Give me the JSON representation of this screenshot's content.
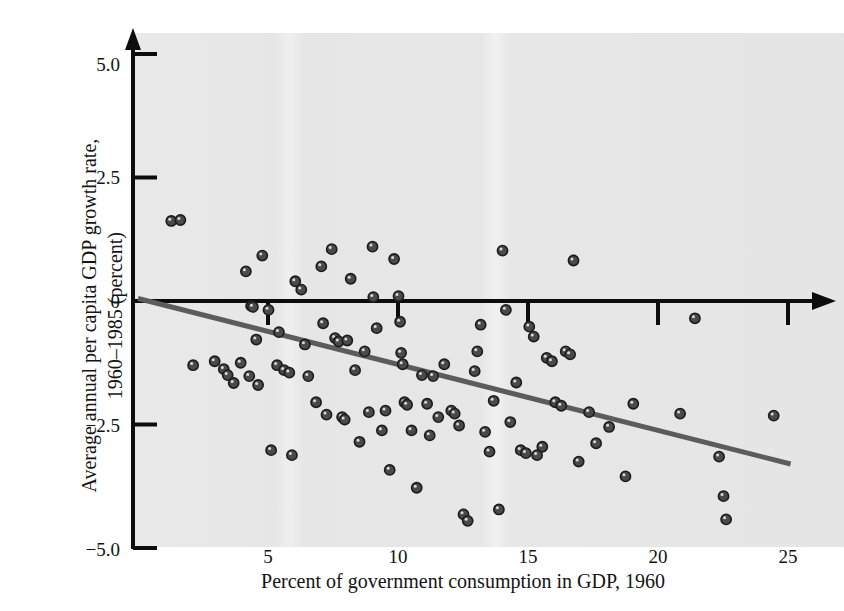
{
  "chart_data": {
    "type": "scatter",
    "title": "",
    "xlabel": "Percent of government consumption in GDP, 1960",
    "ylabel": "Average annual per capita GDP growth rate, 1960–1985 (percent)",
    "ylabel_line1": "Average annual per capita GDP growth rate,",
    "ylabel_line2": "1960–1985 (percent)",
    "xlim": [
      0,
      26.6
    ],
    "ylim": [
      -5.0,
      5.45
    ],
    "grid": false,
    "legend": null,
    "xticks": [
      5,
      10,
      15,
      20,
      25
    ],
    "xtick_labels": [
      "5",
      "10",
      "15",
      "20",
      "25"
    ],
    "yticks": [
      5.0,
      2.5,
      0,
      -2.5,
      -5.0
    ],
    "ytick_labels": [
      "5.0",
      "2.5",
      "0",
      "−2.5",
      "−5.0"
    ],
    "marker_color": "#4a4a4a",
    "marker_edge_color": "#1c1c1c",
    "plot_background_color": "#e8e8e8",
    "axis_color": "#0d0d0d",
    "trendline": {
      "color": "#5c5c5c",
      "x_start": 0.0,
      "y_start": 0.05,
      "x_end": 25.1,
      "y_end": -3.3,
      "width": 5
    },
    "series": [
      {
        "name": "Countries",
        "points": [
          [
            1.28,
            1.62
          ],
          [
            1.63,
            1.64
          ],
          [
            2.12,
            -1.3
          ],
          [
            2.95,
            -1.22
          ],
          [
            3.3,
            -1.38
          ],
          [
            3.45,
            -1.5
          ],
          [
            3.68,
            -1.66
          ],
          [
            3.95,
            -1.25
          ],
          [
            4.15,
            0.6
          ],
          [
            4.35,
            -0.1
          ],
          [
            4.42,
            -0.12
          ],
          [
            4.28,
            -1.52
          ],
          [
            4.55,
            -0.78
          ],
          [
            4.62,
            -1.7
          ],
          [
            4.78,
            0.92
          ],
          [
            5.02,
            -0.18
          ],
          [
            5.12,
            -3.02
          ],
          [
            5.35,
            -1.3
          ],
          [
            5.42,
            -0.63
          ],
          [
            5.62,
            -1.4
          ],
          [
            5.82,
            -1.45
          ],
          [
            5.92,
            -3.12
          ],
          [
            6.05,
            0.4
          ],
          [
            6.28,
            0.23
          ],
          [
            6.42,
            -0.88
          ],
          [
            6.55,
            -1.52
          ],
          [
            6.85,
            -2.05
          ],
          [
            7.05,
            0.7
          ],
          [
            7.12,
            -0.45
          ],
          [
            7.25,
            -2.3
          ],
          [
            7.45,
            1.05
          ],
          [
            7.58,
            -0.75
          ],
          [
            7.72,
            -0.82
          ],
          [
            7.85,
            -2.35
          ],
          [
            7.95,
            -2.4
          ],
          [
            8.05,
            -0.8
          ],
          [
            8.18,
            0.45
          ],
          [
            8.35,
            -1.4
          ],
          [
            8.52,
            -2.85
          ],
          [
            8.72,
            -1.02
          ],
          [
            8.88,
            -2.25
          ],
          [
            9.02,
            1.1
          ],
          [
            9.05,
            0.08
          ],
          [
            9.18,
            -0.55
          ],
          [
            9.38,
            -2.62
          ],
          [
            9.52,
            -2.22
          ],
          [
            9.68,
            -3.42
          ],
          [
            9.85,
            0.85
          ],
          [
            10.02,
            0.1
          ],
          [
            10.08,
            -0.42
          ],
          [
            10.12,
            -1.05
          ],
          [
            10.18,
            -1.28
          ],
          [
            10.25,
            -2.05
          ],
          [
            10.35,
            -2.1
          ],
          [
            10.52,
            -2.62
          ],
          [
            10.72,
            -3.78
          ],
          [
            10.92,
            -1.5
          ],
          [
            11.12,
            -2.08
          ],
          [
            11.22,
            -2.72
          ],
          [
            11.35,
            -1.52
          ],
          [
            11.55,
            -2.35
          ],
          [
            11.78,
            -1.28
          ],
          [
            12.05,
            -2.22
          ],
          [
            12.18,
            -2.28
          ],
          [
            12.35,
            -2.52
          ],
          [
            12.52,
            -4.32
          ],
          [
            12.68,
            -4.45
          ],
          [
            12.95,
            -1.42
          ],
          [
            13.05,
            -1.02
          ],
          [
            13.18,
            -0.48
          ],
          [
            13.35,
            -2.65
          ],
          [
            13.52,
            -3.05
          ],
          [
            13.68,
            -2.02
          ],
          [
            13.88,
            -4.22
          ],
          [
            14.02,
            1.02
          ],
          [
            14.15,
            -0.18
          ],
          [
            14.32,
            -2.45
          ],
          [
            14.55,
            -1.65
          ],
          [
            14.72,
            -3.02
          ],
          [
            14.92,
            -3.08
          ],
          [
            15.05,
            -0.52
          ],
          [
            15.22,
            -0.72
          ],
          [
            15.35,
            -3.12
          ],
          [
            15.55,
            -2.95
          ],
          [
            15.72,
            -1.15
          ],
          [
            15.92,
            -1.22
          ],
          [
            16.05,
            -2.05
          ],
          [
            16.28,
            -2.12
          ],
          [
            16.45,
            -1.02
          ],
          [
            16.62,
            -1.08
          ],
          [
            16.75,
            0.82
          ],
          [
            16.95,
            -3.25
          ],
          [
            17.35,
            -2.25
          ],
          [
            17.62,
            -2.88
          ],
          [
            18.12,
            -2.55
          ],
          [
            18.75,
            -3.55
          ],
          [
            19.05,
            -2.08
          ],
          [
            20.85,
            -2.28
          ],
          [
            21.42,
            -0.35
          ],
          [
            22.35,
            -3.15
          ],
          [
            22.52,
            -3.95
          ],
          [
            22.62,
            -4.42
          ],
          [
            24.45,
            -2.32
          ]
        ]
      }
    ]
  },
  "point_count": 105
}
